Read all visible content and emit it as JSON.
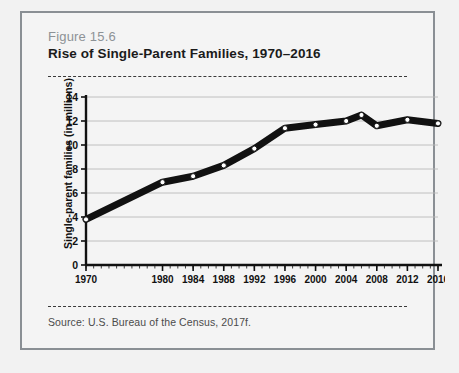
{
  "figure": {
    "number_label": "Figure 15.6",
    "title": "Rise of Single-Parent Families, 1970–2016",
    "source": "Source:  U.S. Bureau of the Census, 2017f."
  },
  "chart_data": {
    "type": "line",
    "title": "Rise of Single-Parent Families, 1970–2016",
    "xlabel": "",
    "ylabel": "Single-parent families (in millions)",
    "xlim": [
      1970,
      2016
    ],
    "ylim": [
      0,
      14
    ],
    "grid": true,
    "legend": null,
    "ytick_labels": [
      "0",
      "2",
      "4",
      "6",
      "8",
      "10",
      "12",
      "14"
    ],
    "ytick_values": [
      0,
      2,
      4,
      6,
      8,
      10,
      12,
      14
    ],
    "xtick_labels": [
      "1970",
      "1980",
      "1984",
      "1988",
      "1992",
      "1996",
      "2000",
      "2004",
      "2008",
      "2012",
      "2016"
    ],
    "xtick_values": [
      1970,
      1980,
      1984,
      1988,
      1992,
      1996,
      2000,
      2004,
      2008,
      2012,
      2016
    ],
    "x": [
      1970,
      1980,
      1984,
      1988,
      1992,
      1996,
      2000,
      2004,
      2006,
      2008,
      2012,
      2016
    ],
    "values": [
      3.8,
      6.9,
      7.4,
      8.3,
      9.7,
      11.4,
      11.7,
      12.0,
      12.5,
      11.6,
      12.1,
      11.8
    ],
    "series": [
      {
        "name": "Single-parent families",
        "x": [
          1970,
          1980,
          1984,
          1988,
          1992,
          1996,
          2000,
          2004,
          2006,
          2008,
          2012,
          2016
        ],
        "values": [
          3.8,
          6.9,
          7.4,
          8.3,
          9.7,
          11.4,
          11.7,
          12.0,
          12.5,
          11.6,
          12.1,
          11.8
        ]
      }
    ],
    "line_color": "#111111",
    "marker_fill": "#ffffff",
    "marker_edge": "#111111"
  },
  "colors": {
    "border": "#8a8f94",
    "fig_label": "#8d9296",
    "title": "#1b1b1b",
    "dash_rule": "#3a3a3a",
    "grid": "#b9b9b9",
    "axis": "#111111",
    "page_bg": "#f2f2f2",
    "card_bg": "#f4f4f4"
  }
}
